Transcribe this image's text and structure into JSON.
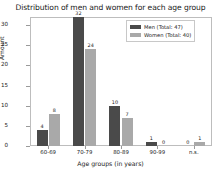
{
  "chart_data": {
    "type": "bar",
    "title": "Distribution of men and women for each age group",
    "xlabel": "Age groups (in years)",
    "ylabel": "Amount",
    "categories": [
      "60-69",
      "70-79",
      "80-89",
      "90-99",
      "n.s."
    ],
    "series": [
      {
        "name": "Men (Total: 47)",
        "key": "men",
        "color": "#4a4a4a",
        "values": [
          4,
          32,
          10,
          1,
          0
        ]
      },
      {
        "name": "Women (Total: 40)",
        "key": "women",
        "color": "#a9a9a9",
        "values": [
          8,
          24,
          7,
          0,
          1
        ]
      }
    ],
    "ylim": [
      0,
      32
    ],
    "yticks": [
      0,
      5,
      10,
      15,
      20,
      25,
      30
    ],
    "grid": false,
    "legend_position": "top-right",
    "show_value_labels": true
  }
}
